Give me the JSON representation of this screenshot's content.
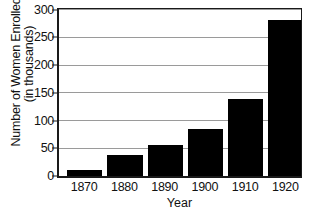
{
  "chart_data": {
    "type": "bar",
    "title": "",
    "subtitle": "",
    "xlabel": "Year",
    "ylabel_line1": "Number of Women Enrolled",
    "ylabel_line2": "(in thousands)",
    "ylabel": "Number of Women Enrolled (in thousands)",
    "categories": [
      "1870",
      "1880",
      "1890",
      "1900",
      "1910",
      "1920"
    ],
    "values": [
      10,
      38,
      55,
      84,
      139,
      281
    ],
    "ylim": [
      0,
      300
    ],
    "ytick_values": [
      0,
      50,
      100,
      150,
      200,
      250,
      300
    ],
    "ytick_labels": [
      "0",
      "50",
      "100",
      "150",
      "200",
      "250",
      "300"
    ],
    "grid": true,
    "grid_axis": "y",
    "legend": false,
    "legend_position": "none",
    "bar_color": "#000000",
    "grid_color": "#9a9a9a",
    "axis_color": "#1a1a1a",
    "background_color": "#ffffff",
    "text_color": "#111111"
  }
}
